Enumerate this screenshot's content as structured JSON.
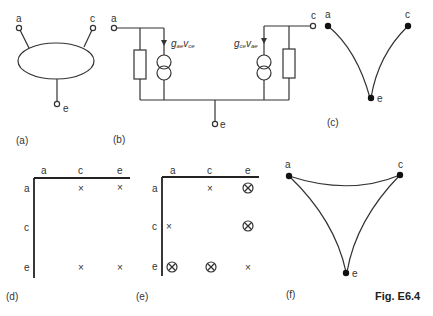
{
  "figure": {
    "title": "Fig. E6.4",
    "panels": {
      "a": {
        "caption": "(a)",
        "terminals": {
          "a": "a",
          "c": "c",
          "e": "e"
        }
      },
      "b": {
        "caption": "(b)",
        "terminals": {
          "a": "a",
          "c": "c",
          "e": "e"
        },
        "left_source": {
          "g": "g",
          "g_sub": "ae",
          "v": "v",
          "v_sub": "ce"
        },
        "right_source": {
          "g": "g",
          "g_sub": "ce",
          "v": "v",
          "v_sub": "ae"
        }
      },
      "c": {
        "caption": "(c)",
        "nodes": {
          "a": "a",
          "c": "c",
          "e": "e"
        },
        "edges": [
          [
            "a",
            "e"
          ],
          [
            "c",
            "e"
          ]
        ]
      },
      "d": {
        "caption": "(d)",
        "col_headers": [
          "a",
          "c",
          "e"
        ],
        "row_headers": [
          "a",
          "c",
          "e"
        ],
        "cells": [
          [
            "",
            "×",
            "×"
          ],
          [
            "",
            "",
            ""
          ],
          [
            "",
            "×",
            "×"
          ]
        ]
      },
      "e": {
        "caption": "(e)",
        "col_headers": [
          "a",
          "c",
          "e"
        ],
        "row_headers": [
          "a",
          "c",
          "e"
        ],
        "cells": [
          [
            "",
            "×",
            "⊗"
          ],
          [
            "×",
            "",
            "⊗"
          ],
          [
            "⊗",
            "⊗",
            "×"
          ]
        ]
      },
      "f": {
        "caption": "(f)",
        "nodes": {
          "a": "a",
          "c": "c",
          "e": "e"
        },
        "edges": [
          [
            "a",
            "c"
          ],
          [
            "a",
            "e"
          ],
          [
            "c",
            "e"
          ]
        ]
      }
    }
  }
}
